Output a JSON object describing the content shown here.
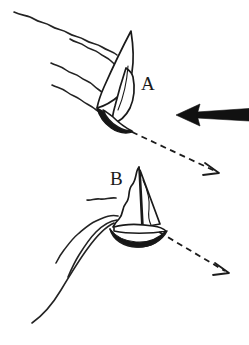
{
  "figure": {
    "background_color": "#ffffff",
    "ink_color": "#1a1a1a",
    "width": 249,
    "height": 345
  },
  "labels": [
    {
      "id": "boat-a",
      "text": "A",
      "x": 141,
      "y": 90
    },
    {
      "id": "boat-b",
      "text": "B",
      "x": 110,
      "y": 185
    }
  ],
  "wind_arrow": {
    "name": "wind-direction-arrow",
    "style": "solid-bold",
    "color": "#111111",
    "direction": "left",
    "from_x": 249,
    "from_y": 115,
    "to_x": 176,
    "to_y": 115
  },
  "course_arrows": [
    {
      "id": "course-arrow-a",
      "style": "dashed",
      "from_x": 132,
      "from_y": 132,
      "to_x": 219,
      "to_y": 173,
      "direction": "down-right"
    },
    {
      "id": "course-arrow-b",
      "style": "dashed",
      "from_x": 159,
      "from_y": 232,
      "to_x": 229,
      "to_y": 273,
      "direction": "down-right"
    }
  ],
  "boats": [
    {
      "id": "boat-a",
      "label": "A",
      "state": "heeled-sailing",
      "sails": [
        "mainsail",
        "jib"
      ],
      "hull_style": "dark-heeled"
    },
    {
      "id": "boat-b",
      "label": "B",
      "state": "head-to-wind-luffing",
      "sails": [
        "mainsail",
        "jib"
      ],
      "hull_style": "bow-on-ellipse"
    }
  ],
  "flow_lines": {
    "name": "wavy-flow-lines",
    "group_a_count": 4,
    "group_b_count": 4,
    "color": "#232323"
  }
}
